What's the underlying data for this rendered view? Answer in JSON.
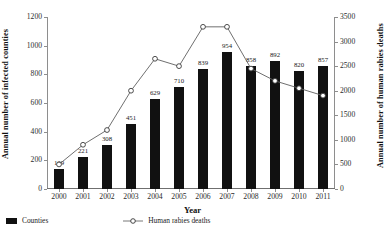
{
  "chart_data": {
    "type": "bar",
    "title": "",
    "xlabel": "Year",
    "ylabel": "Annual number of infected counties",
    "y2label": "Annual number of human rabies deaths",
    "categories": [
      "2000",
      "2001",
      "2002",
      "2003",
      "2004",
      "2005",
      "2006",
      "2007",
      "2008",
      "2009",
      "2010",
      "2011"
    ],
    "ylim": [
      0,
      1200
    ],
    "y2lim": [
      0,
      3500
    ],
    "yticks": [
      0,
      200,
      400,
      600,
      800,
      1000,
      1200
    ],
    "y2ticks": [
      0,
      500,
      1000,
      1500,
      2000,
      2500,
      3000,
      3500
    ],
    "grid": false,
    "legend_position": "bottom-left",
    "series": [
      {
        "name": "Counties",
        "type": "bar",
        "axis": "left",
        "color": "#111111",
        "values": [
          139,
          221,
          308,
          451,
          629,
          710,
          839,
          954,
          858,
          892,
          820,
          857
        ],
        "labels": [
          "139",
          "221",
          "308",
          "451",
          "629",
          "710",
          "839",
          "954",
          "858",
          "892",
          "820",
          "857"
        ]
      },
      {
        "name": "Human rabies deaths",
        "type": "line",
        "axis": "right",
        "color": "#6b6b6b",
        "marker": "open-circle",
        "values": [
          500,
          900,
          1200,
          2000,
          2650,
          2500,
          3300,
          3300,
          2450,
          2200,
          2050,
          1900
        ]
      }
    ]
  },
  "legend": {
    "items": [
      {
        "label": "Counties",
        "marker": "filled-square",
        "color": "#111111"
      },
      {
        "label": "Human rabies deaths",
        "marker": "line-open-circle",
        "color": "#6b6b6b"
      }
    ]
  },
  "axes": {
    "left_title": "Annual number of infected counties",
    "right_title": "Annual number of human rabies deaths",
    "x_title": "Year"
  }
}
